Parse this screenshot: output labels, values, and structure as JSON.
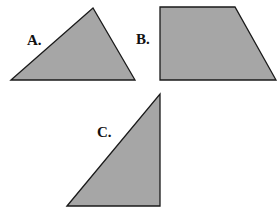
{
  "colors": {
    "fill": "#a6a6a6",
    "stroke": "#1a1a1a",
    "label": "#111111",
    "background": "#ffffff"
  },
  "shapes": [
    {
      "id": "A",
      "label": "A.",
      "kind": "triangle",
      "points": "11,80 93,8 135,80",
      "label_pos": {
        "x": 27,
        "y": 45
      }
    },
    {
      "id": "B",
      "label": "B.",
      "kind": "trapezoid",
      "points": "160,7 235,7 276,80 160,80",
      "label_pos": {
        "x": 136,
        "y": 44
      }
    },
    {
      "id": "C",
      "label": "C.",
      "kind": "right-triangle",
      "points": "67,206 160,94 160,206",
      "label_pos": {
        "x": 97,
        "y": 137
      }
    }
  ]
}
